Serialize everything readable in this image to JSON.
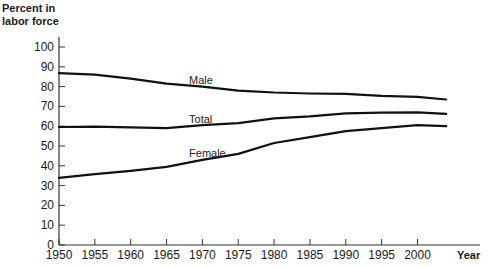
{
  "chart_data": {
    "type": "line",
    "title": "",
    "xlabel": "Year",
    "ylabel": "Percent in labor force",
    "ylabel_lines": [
      "Percent in",
      "labor force"
    ],
    "xlim": [
      1950,
      2008
    ],
    "ylim": [
      0,
      100
    ],
    "grid": false,
    "legend": "inline labels",
    "x_ticks": [
      1950,
      1955,
      1960,
      1965,
      1970,
      1975,
      1980,
      1985,
      1990,
      1995,
      2000
    ],
    "y_ticks": [
      0,
      10,
      20,
      30,
      40,
      50,
      60,
      70,
      80,
      90,
      100
    ],
    "x": [
      1950,
      1955,
      1960,
      1965,
      1970,
      1975,
      1980,
      1985,
      1990,
      1995,
      2000,
      2004
    ],
    "series": [
      {
        "name": "Male",
        "label_pos": [
          1968,
          84
        ],
        "values": [
          86.8,
          86.0,
          84.0,
          81.5,
          80.0,
          78.0,
          77.0,
          76.5,
          76.3,
          75.3,
          74.8,
          73.5
        ]
      },
      {
        "name": "Total",
        "label_pos": [
          1968,
          64
        ],
        "values": [
          59.6,
          59.8,
          59.4,
          59.0,
          60.5,
          61.5,
          64.0,
          65.0,
          66.5,
          66.8,
          67.0,
          66.2
        ]
      },
      {
        "name": "Female",
        "label_pos": [
          1968,
          47
        ],
        "values": [
          33.9,
          35.8,
          37.5,
          39.5,
          43.0,
          46.0,
          51.5,
          54.5,
          57.5,
          59.0,
          60.5,
          60.0
        ]
      }
    ]
  }
}
